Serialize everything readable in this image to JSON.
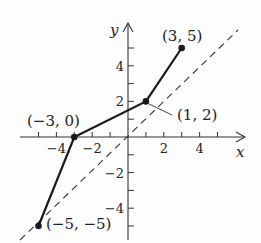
{
  "figure": {
    "x_axis_label": "x",
    "y_axis_label": "y",
    "x_ticks": [
      -5,
      -4,
      -3,
      -2,
      -1,
      1,
      2,
      3,
      4,
      5
    ],
    "x_tick_labels": [
      {
        "v": -4,
        "t": "−4"
      },
      {
        "v": -2,
        "t": "−2"
      },
      {
        "v": 2,
        "t": "2"
      },
      {
        "v": 4,
        "t": "4"
      }
    ],
    "y_ticks": [
      -5,
      -4,
      -3,
      -2,
      -1,
      1,
      2,
      3,
      4,
      5
    ],
    "y_tick_labels": [
      {
        "v": 4,
        "t": "4"
      },
      {
        "v": 2,
        "t": "2"
      },
      {
        "v": -2,
        "t": "−2"
      },
      {
        "v": -4,
        "t": "−4"
      }
    ],
    "polyline_points": [
      [
        -5,
        -5
      ],
      [
        -3,
        0
      ],
      [
        1,
        2
      ],
      [
        3,
        5
      ]
    ],
    "point_labels": [
      {
        "x": -5,
        "y": -5,
        "text": "(−5, −5)"
      },
      {
        "x": -3,
        "y": 0,
        "text": "(−3, 0)"
      },
      {
        "x": 1,
        "y": 2,
        "text": "(1, 2)"
      },
      {
        "x": 3,
        "y": 5,
        "text": "(3, 5)"
      }
    ],
    "reference_line": "y = x (dashed)",
    "colors": {
      "ink": "#1a1a1a",
      "background": "#fdfdfd"
    }
  }
}
